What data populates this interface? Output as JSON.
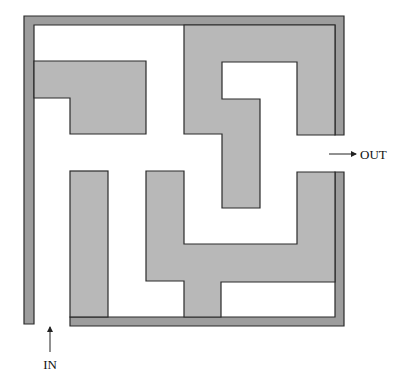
{
  "diagram": {
    "type": "maze",
    "labels": {
      "entrance": "IN",
      "exit": "OUT"
    },
    "colors": {
      "wall": "#9d9d9d",
      "block": "#b8b8b8",
      "outline": "#2a2a2a",
      "background": "#ffffff"
    }
  }
}
